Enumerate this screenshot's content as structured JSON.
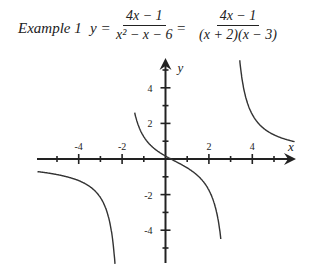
{
  "header": {
    "example_label": "Example 1",
    "lhs": "y =",
    "fraction1": {
      "numerator": "4x − 1",
      "denominator": "x² − x − 6"
    },
    "equals": "=",
    "fraction2": {
      "numerator": "4x − 1",
      "denominator": "(x + 2)(x − 3)"
    }
  },
  "axes": {
    "x_label": "x",
    "y_label": "y",
    "x_tick_labels": [
      "-4",
      "-2",
      "2",
      "4"
    ],
    "y_tick_labels": [
      "4",
      "2",
      "-2",
      "-4"
    ]
  },
  "chart_data": {
    "type": "line",
    "xlabel": "x",
    "ylabel": "y",
    "xlim": [
      -6,
      6
    ],
    "ylim": [
      -6,
      6
    ],
    "grid": false,
    "x_ticks": [
      -5,
      -4,
      -3,
      -2,
      -1,
      1,
      2,
      3,
      4,
      5
    ],
    "x_tick_labels": {
      "-4": "-4",
      "-2": "-2",
      "2": "2",
      "4": "4"
    },
    "y_ticks": [
      -5,
      -4,
      -3,
      -2,
      -1,
      1,
      2,
      3,
      4,
      5
    ],
    "y_tick_labels": {
      "4": "4",
      "2": "2",
      "-2": "-2",
      "-4": "-4"
    },
    "vertical_asymptotes": [
      -2,
      3
    ],
    "horizontal_asymptote": 0,
    "series": [
      {
        "name": "left branch (x < -2)",
        "x": [
          -5.9,
          -5,
          -4,
          -3,
          -2.5,
          -2.2
        ],
        "y": [
          -0.7,
          -0.88,
          -1.21,
          -2.17,
          -4.18,
          -8.3
        ]
      },
      {
        "name": "middle branch (-2 < x < 3)",
        "x": [
          -1.45,
          -1,
          0,
          0.25,
          1,
          2,
          2.6
        ],
        "y": [
          5.6,
          1.25,
          0.17,
          0,
          -0.5,
          -1.75,
          -6.6
        ]
      },
      {
        "name": "right branch (x > 3)",
        "x": [
          3.4,
          4,
          5,
          6
        ],
        "y": [
          5.1,
          2.5,
          1.36,
          0.96
        ]
      }
    ]
  }
}
